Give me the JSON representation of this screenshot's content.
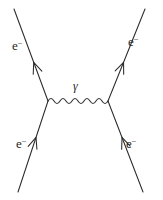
{
  "figure": {
    "kind": "feynman-diagram",
    "background_color": "#ffffff",
    "line_color": "#2b2b2b",
    "text_color": "#1f1f1f",
    "width": 163,
    "height": 200
  },
  "labels": {
    "incoming_left": {
      "symbol": "e",
      "charge": "−",
      "x": 16,
      "y": 148
    },
    "incoming_right": {
      "symbol": "e",
      "charge": "−",
      "x": 126,
      "y": 148
    },
    "outgoing_left": {
      "symbol": "e",
      "charge": "−",
      "x": 12,
      "y": 50
    },
    "outgoing_right": {
      "symbol": "e",
      "charge": "−",
      "x": 128,
      "y": 46
    },
    "mediator": {
      "symbol": "γ",
      "x": 73,
      "y": 90
    }
  },
  "vertices": {
    "left": {
      "x": 48,
      "y": 101
    },
    "right": {
      "x": 108,
      "y": 101
    }
  },
  "legs": [
    {
      "name": "outgoing-electron-left",
      "from_x": 48,
      "from_y": 101,
      "to_x": 14,
      "to_y": 9,
      "arrow_at": 0.42
    },
    {
      "name": "outgoing-electron-right",
      "from_x": 108,
      "from_y": 101,
      "to_x": 145,
      "to_y": 9,
      "arrow_at": 0.42
    },
    {
      "name": "incoming-electron-left",
      "from_x": 18,
      "from_y": 192,
      "to_x": 48,
      "to_y": 101,
      "arrow_at": 0.6
    },
    {
      "name": "incoming-electron-right",
      "from_x": 143,
      "from_y": 192,
      "to_x": 108,
      "to_y": 101,
      "arrow_at": 0.6
    }
  ],
  "photon": {
    "name": "virtual-photon-propagator",
    "start_x": 48,
    "start_y": 101,
    "end_x": 108,
    "end_y": 101,
    "wave_count": 5,
    "amplitude": 5
  }
}
